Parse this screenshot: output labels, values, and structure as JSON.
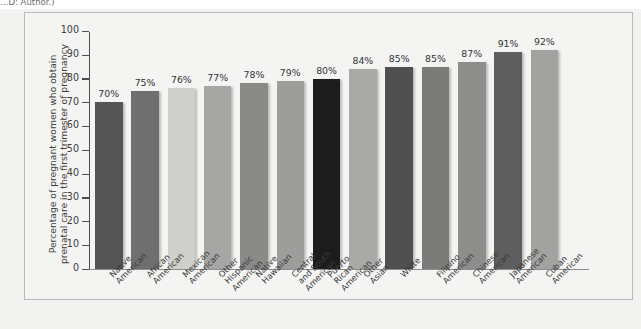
{
  "caption_fragment": "…D: Author.)",
  "chart_data": {
    "type": "bar",
    "title": "",
    "subtitle": "",
    "xlabel": "",
    "ylabel": "Percentage of pregnant women who obtain prenatal care in the first trimester of pregnancy",
    "ylabel_line1": "Percentage of pregnant women who obtain",
    "ylabel_line2": "prenatal care in the first trimester of pregnancy",
    "ylim": [
      0,
      100
    ],
    "ytick_step": 10,
    "yticks": [
      0,
      10,
      20,
      30,
      40,
      50,
      60,
      70,
      80,
      90,
      100
    ],
    "ytick_labels": [
      "0",
      "10",
      "20",
      "30",
      "40",
      "50",
      "60",
      "70",
      "80",
      "90",
      "100"
    ],
    "grid": false,
    "legend": "none",
    "value_label_suffix": "%",
    "categories": [
      "Native\nAmerican",
      "African\nAmerican",
      "Mexican\nAmerican",
      "Other\nHispanic\nAmerican",
      "Native\nHawaiian",
      "Central\nand South\nAmerican",
      "Puerto\nRican\nAmerican",
      "Other\nAsian",
      "White",
      "Filipino\nAmerican",
      "Chinese\nAmerican",
      "Japanese\nAmerican",
      "Cuban\nAmerican"
    ],
    "values": [
      70,
      75,
      76,
      77,
      78,
      79,
      80,
      84,
      85,
      85,
      87,
      91,
      92
    ],
    "value_labels": [
      "70%",
      "75%",
      "76%",
      "77%",
      "78%",
      "79%",
      "80%",
      "84%",
      "85%",
      "85%",
      "87%",
      "91%",
      "92%"
    ],
    "bar_colors": [
      "#555555",
      "#6f6f6f",
      "#cfcfcb",
      "#a6a6a4",
      "#8a8a88",
      "#9d9d9b",
      "#1c1c1c",
      "#a9a9a7",
      "#4f4f4f",
      "#7b7b79",
      "#8d8d8b",
      "#5e5e5e",
      "#a2a2a0"
    ]
  },
  "colors": {
    "page_background": "#ffffff",
    "panel_background": "#f2f2f1",
    "plot_background": "#f4f4f3",
    "axis": "#4d4d4d",
    "frame_border": "#b9b9b9",
    "text": "#3a3a3a"
  }
}
